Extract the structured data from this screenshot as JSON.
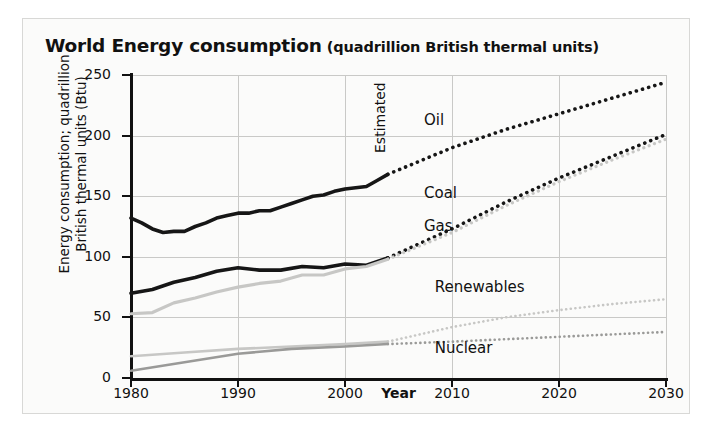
{
  "title": {
    "main": "World Energy consumption",
    "sub": "(quadrillion British thermal units)"
  },
  "chart_data": {
    "type": "line",
    "title": "World Energy consumption (quadrillion British thermal units)",
    "xlabel": "Year",
    "ylabel": "Energy consumption; quadrillion\nBritish thermal units (Btu)",
    "xlim": [
      1980,
      2030
    ],
    "ylim": [
      0,
      250
    ],
    "xticks": [
      1980,
      1990,
      2000,
      2010,
      2020,
      2030
    ],
    "yticks": [
      0,
      50,
      100,
      150,
      200,
      250
    ],
    "grid": true,
    "legend_position": "inline-labels",
    "forecast_start_year": 2004,
    "annotations": [
      {
        "text": "Estimated",
        "x": 2004,
        "rotation": -90
      }
    ],
    "series": [
      {
        "name": "Oil",
        "color": "#161616",
        "x": [
          1980,
          1981,
          1982,
          1983,
          1984,
          1985,
          1986,
          1987,
          1988,
          1989,
          1990,
          1991,
          1992,
          1993,
          1994,
          1995,
          1996,
          1997,
          1998,
          1999,
          2000,
          2001,
          2002,
          2003,
          2004,
          2010,
          2015,
          2020,
          2025,
          2030
        ],
        "values": [
          132,
          128,
          123,
          120,
          121,
          121,
          125,
          128,
          132,
          134,
          136,
          136,
          138,
          138,
          141,
          144,
          147,
          150,
          151,
          154,
          156,
          157,
          158,
          163,
          168,
          190,
          205,
          218,
          231,
          244
        ]
      },
      {
        "name": "Coal",
        "color": "#161616",
        "x": [
          1980,
          1982,
          1984,
          1986,
          1988,
          1990,
          1992,
          1994,
          1996,
          1998,
          2000,
          2002,
          2004,
          2010,
          2015,
          2020,
          2025,
          2030
        ],
        "values": [
          70,
          73,
          79,
          83,
          88,
          91,
          89,
          89,
          92,
          91,
          94,
          93,
          99,
          123,
          145,
          165,
          183,
          201
        ]
      },
      {
        "name": "Gas",
        "color": "#c7c7c5",
        "x": [
          1980,
          1982,
          1984,
          1986,
          1988,
          1990,
          1992,
          1994,
          1996,
          1998,
          2000,
          2002,
          2004,
          2010,
          2015,
          2020,
          2025,
          2030
        ],
        "values": [
          53,
          54,
          62,
          66,
          71,
          75,
          78,
          80,
          85,
          85,
          90,
          92,
          98,
          120,
          142,
          162,
          180,
          197
        ]
      },
      {
        "name": "Renewables",
        "color": "#c7c7c5",
        "x": [
          1980,
          1985,
          1990,
          1995,
          2000,
          2004,
          2010,
          2015,
          2020,
          2025,
          2030
        ],
        "values": [
          18,
          21,
          24,
          26,
          28,
          30,
          42,
          50,
          56,
          61,
          65
        ]
      },
      {
        "name": "Nuclear",
        "color": "#9a9a98",
        "x": [
          1980,
          1985,
          1990,
          1995,
          2000,
          2004,
          2010,
          2015,
          2020,
          2025,
          2030
        ],
        "values": [
          6,
          13,
          20,
          24,
          26,
          28,
          30,
          32,
          34,
          36,
          38
        ]
      }
    ],
    "series_labels": [
      {
        "name": "Oil",
        "x": 2010,
        "y": 212
      },
      {
        "name": "Coal",
        "x": 2010,
        "y": 152
      },
      {
        "name": "Gas",
        "x": 2010,
        "y": 125
      },
      {
        "name": "Renewables",
        "x": 2011,
        "y": 74
      },
      {
        "name": "Nuclear",
        "x": 2011,
        "y": 24
      }
    ]
  }
}
